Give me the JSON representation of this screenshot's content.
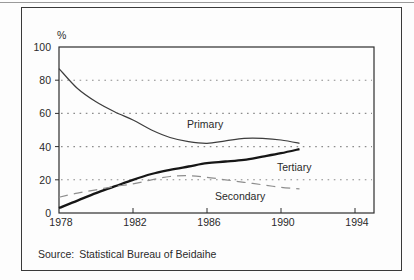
{
  "figure": {
    "percent_symbol": "%",
    "source_label": "Source:",
    "source_text": "Statistical Bureau of Beidaihe"
  },
  "colors": {
    "frame": "#3a3a3a",
    "axis": "#2e2e2e",
    "grid": "#8c8c8c",
    "text": "#2a2a2a"
  },
  "chart_data": {
    "type": "line",
    "title": "",
    "xlabel": "",
    "ylabel": "%",
    "x": [
      1978,
      1979,
      1980,
      1981,
      1982,
      1983,
      1984,
      1985,
      1986,
      1987,
      1988,
      1989,
      1990,
      1991
    ],
    "x_ticks": [
      1978,
      1982,
      1986,
      1990,
      1994
    ],
    "x_tick_marks": [
      1982,
      1986,
      1990,
      1994
    ],
    "y_ticks": [
      0,
      20,
      40,
      60,
      80,
      100
    ],
    "y_gridlines": [
      20,
      40,
      60,
      80
    ],
    "xlim": [
      1978,
      1995
    ],
    "ylim": [
      0,
      100
    ],
    "grid": "horizontal-dotted",
    "legend_position": "inline-labels",
    "series": [
      {
        "name": "Primary",
        "style": "solid",
        "width": 1.2,
        "color": "#3d3d3d",
        "values": [
          87,
          75,
          67,
          61,
          56,
          50,
          45.5,
          43,
          42,
          43.5,
          45,
          45,
          44,
          42
        ]
      },
      {
        "name": "Tertiary",
        "style": "solid",
        "width": 2.3,
        "color": "#161616",
        "values": [
          3,
          7.5,
          12,
          16,
          20,
          23.5,
          26,
          28,
          30,
          31,
          32,
          34,
          36,
          38.5
        ]
      },
      {
        "name": "Secondary",
        "style": "dashed",
        "width": 1.2,
        "color": "#8e8e8e",
        "values": [
          9.5,
          12,
          14,
          16,
          17.5,
          20,
          22,
          22.5,
          21.5,
          20,
          18.5,
          17,
          15.5,
          14.5
        ]
      }
    ],
    "source": "Source: Statistical Bureau of Beidaihe"
  }
}
